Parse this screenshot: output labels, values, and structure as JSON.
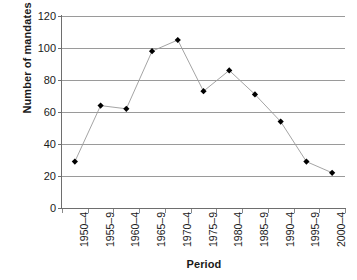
{
  "chart_data": {
    "type": "line",
    "title": "",
    "xlabel": "Period",
    "ylabel": "Number of mandates",
    "categories": [
      "1950–4",
      "1955–9",
      "1960–4",
      "1965–9",
      "1970–4",
      "1975–9",
      "1980–4",
      "1985–9",
      "1990–4",
      "1995–9",
      "2000–4"
    ],
    "values": [
      29,
      64,
      62,
      98,
      105,
      73,
      86,
      71,
      54,
      29,
      22
    ],
    "series": [
      {
        "name": "Number of mandates",
        "values": [
          29,
          64,
          62,
          98,
          105,
          73,
          86,
          71,
          54,
          29,
          22
        ]
      }
    ],
    "ylim": [
      0,
      120
    ],
    "y_ticks": [
      0,
      20,
      40,
      60,
      80,
      100,
      120
    ],
    "y_tick_labels": [
      "0",
      "20",
      "40",
      "60",
      "80",
      "100",
      "120"
    ],
    "grid": true,
    "grid_axis": "y",
    "legend": false,
    "legend_position": "none",
    "marker": "diamond",
    "marker_color": "#000000",
    "line_color": "#9a9a9a",
    "grid_color": "#9a9a9a",
    "axis_color": "#6e6e6e",
    "background_color": "#ffffff"
  }
}
